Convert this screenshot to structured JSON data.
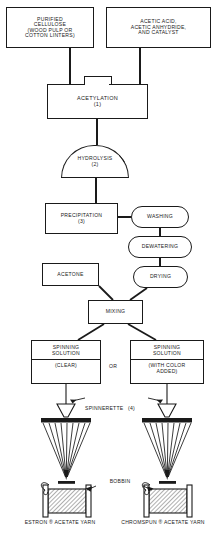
{
  "diagram": {
    "nodes": {
      "cellulose": {
        "line1": "PURIFIED",
        "line2": "CELLULOSE",
        "line3": "(WOOD PULP OR",
        "line4": "COTTON LINTERS)"
      },
      "acids": {
        "line1": "ACETIC ACID,",
        "line2": "ACETIC ANHYDRIDE,",
        "line3": "AND CATALYST"
      },
      "acetylation": {
        "label": "ACETYLATION",
        "step": "(1)"
      },
      "hydrolysis": {
        "label": "HYDROLYSIS",
        "step": "(2)"
      },
      "precipitation": {
        "label": "PRECIPITATION",
        "step": "(3)"
      },
      "washing": {
        "label": "WASHING"
      },
      "dewatering": {
        "label": "DEWATERING"
      },
      "drying": {
        "label": "DRYING"
      },
      "acetone": {
        "label": "ACETONE"
      },
      "mixing": {
        "label": "MIXING"
      },
      "spinning_solution_left": {
        "line1": "SPINNING",
        "line2": "SOLUTION",
        "line3": "(CLEAR)"
      },
      "spinning_solution_right": {
        "line1": "SPINNING",
        "line2": "SOLUTION",
        "line3": "(WITH COLOR",
        "line4": "ADDED)"
      },
      "or": {
        "label": "OR"
      },
      "spinnerette": {
        "label": "SPINNERETTE",
        "step": "(4)"
      },
      "bobbin": {
        "label": "BOBBIN"
      },
      "yarn_left": {
        "line1": "ESTRON ® ACETATE",
        "line2": "YARN"
      },
      "yarn_right": {
        "line1": "CHROMSPUN ® ACETATE",
        "line2": "YARN"
      }
    },
    "colors": {
      "line": "#1a1a1a",
      "background": "#ffffff",
      "fill": "#ffffff"
    }
  }
}
